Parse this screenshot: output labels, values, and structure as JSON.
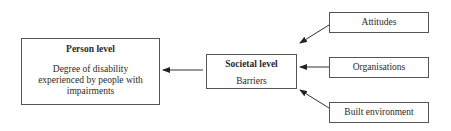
{
  "diagram": {
    "person": {
      "title": "Person level",
      "body": "Degree of disability experienced by people with impairments"
    },
    "societal": {
      "title": "Societal level",
      "body": "Barriers"
    },
    "factors": [
      {
        "label": "Attitudes"
      },
      {
        "label": "Organisations"
      },
      {
        "label": "Built environment"
      }
    ],
    "edges": [
      {
        "from": "Attitudes",
        "to": "Societal level"
      },
      {
        "from": "Organisations",
        "to": "Societal level"
      },
      {
        "from": "Built environment",
        "to": "Societal level"
      },
      {
        "from": "Societal level",
        "to": "Person level"
      }
    ]
  }
}
